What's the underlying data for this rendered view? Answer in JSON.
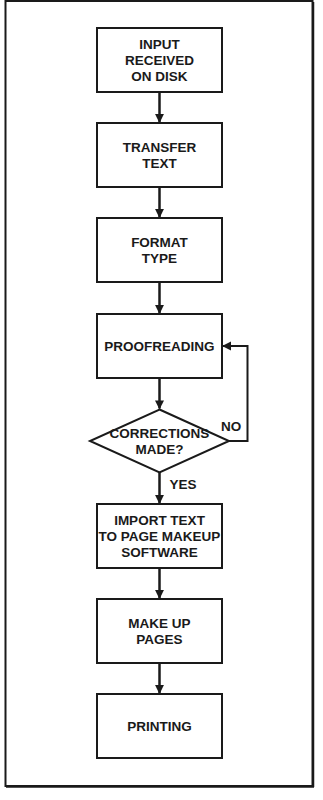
{
  "diagram": {
    "type": "flowchart",
    "nodes": [
      {
        "id": "input",
        "shape": "rect",
        "lines": [
          "INPUT",
          "RECEIVED",
          "ON DISK"
        ]
      },
      {
        "id": "transfer",
        "shape": "rect",
        "lines": [
          "TRANSFER",
          "TEXT"
        ]
      },
      {
        "id": "format",
        "shape": "rect",
        "lines": [
          "FORMAT",
          "TYPE"
        ]
      },
      {
        "id": "proofreading",
        "shape": "rect",
        "lines": [
          "PROOFREADING"
        ]
      },
      {
        "id": "corrections",
        "shape": "diamond",
        "lines": [
          "CORRECTIONS",
          "MADE?"
        ]
      },
      {
        "id": "import",
        "shape": "rect",
        "lines": [
          "IMPORT  TEXT",
          "TO PAGE MAKEUP",
          "SOFTWARE"
        ]
      },
      {
        "id": "makeup",
        "shape": "rect",
        "lines": [
          "MAKE UP",
          "PAGES"
        ]
      },
      {
        "id": "printing",
        "shape": "rect",
        "lines": [
          "PRINTING"
        ]
      }
    ],
    "edges": [
      {
        "from": "input",
        "to": "transfer",
        "label": ""
      },
      {
        "from": "transfer",
        "to": "format",
        "label": ""
      },
      {
        "from": "format",
        "to": "proofreading",
        "label": ""
      },
      {
        "from": "proofreading",
        "to": "corrections",
        "label": ""
      },
      {
        "from": "corrections",
        "to": "import",
        "label": "YES"
      },
      {
        "from": "corrections",
        "to": "proofreading",
        "label": "NO"
      },
      {
        "from": "import",
        "to": "makeup",
        "label": ""
      },
      {
        "from": "makeup",
        "to": "printing",
        "label": ""
      }
    ],
    "colors": {
      "stroke": "#1a1a1a",
      "background": "#ffffff"
    }
  }
}
